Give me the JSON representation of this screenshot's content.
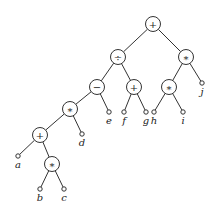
{
  "diagram": {
    "type": "expression-tree",
    "operators": [
      {
        "id": "n_root",
        "symbol": "+",
        "x": 153,
        "y": 24
      },
      {
        "id": "n_div",
        "symbol": "÷",
        "x": 118,
        "y": 57
      },
      {
        "id": "n_mul_r",
        "symbol": "*",
        "x": 186,
        "y": 57
      },
      {
        "id": "n_minus",
        "symbol": "−",
        "x": 97,
        "y": 87
      },
      {
        "id": "n_plus_m",
        "symbol": "+",
        "x": 134,
        "y": 87
      },
      {
        "id": "n_mul_hi",
        "symbol": "*",
        "x": 169,
        "y": 87
      },
      {
        "id": "n_mul_l",
        "symbol": "*",
        "x": 70,
        "y": 109
      },
      {
        "id": "n_plus_l",
        "symbol": "+",
        "x": 40,
        "y": 135
      },
      {
        "id": "n_mul_bc",
        "symbol": "*",
        "x": 52,
        "y": 164
      }
    ],
    "leaves": [
      {
        "id": "l_a",
        "label": "a",
        "x": 18,
        "y": 156
      },
      {
        "id": "l_b",
        "label": "b",
        "x": 40,
        "y": 189
      },
      {
        "id": "l_c",
        "label": "c",
        "x": 64,
        "y": 189
      },
      {
        "id": "l_d",
        "label": "d",
        "x": 82,
        "y": 134
      },
      {
        "id": "l_e",
        "label": "e",
        "x": 109,
        "y": 112
      },
      {
        "id": "l_f",
        "label": "f",
        "x": 124,
        "y": 112
      },
      {
        "id": "l_g",
        "label": "g",
        "x": 146,
        "y": 112
      },
      {
        "id": "l_h",
        "label": "h",
        "x": 154,
        "y": 112
      },
      {
        "id": "l_i",
        "label": "i",
        "x": 183,
        "y": 112
      },
      {
        "id": "l_j",
        "label": "j",
        "x": 202,
        "y": 83
      }
    ],
    "edges": [
      [
        "n_root",
        "n_div"
      ],
      [
        "n_root",
        "n_mul_r"
      ],
      [
        "n_div",
        "n_minus"
      ],
      [
        "n_div",
        "n_plus_m"
      ],
      [
        "n_mul_r",
        "n_mul_hi"
      ],
      [
        "n_mul_r",
        "l_j"
      ],
      [
        "n_minus",
        "n_mul_l"
      ],
      [
        "n_minus",
        "l_e"
      ],
      [
        "n_plus_m",
        "l_f"
      ],
      [
        "n_plus_m",
        "l_g"
      ],
      [
        "n_mul_hi",
        "l_h"
      ],
      [
        "n_mul_hi",
        "l_i"
      ],
      [
        "n_mul_l",
        "n_plus_l"
      ],
      [
        "n_mul_l",
        "l_d"
      ],
      [
        "n_plus_l",
        "l_a"
      ],
      [
        "n_plus_l",
        "n_mul_bc"
      ],
      [
        "n_mul_bc",
        "l_b"
      ],
      [
        "n_mul_bc",
        "l_c"
      ]
    ],
    "expression": "((a + b * c) * d - e) ÷ (f + g) + h * i * j"
  }
}
